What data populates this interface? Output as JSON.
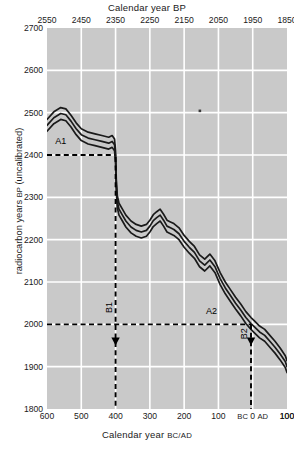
{
  "chart_data": {
    "type": "line",
    "title": "Calendar year BP",
    "xlabel": "Calendar year BC/AD",
    "ylabel": "radiocarbon years BP (uncalibrated)",
    "xlabel_top": "Calendar year BP",
    "ylim": [
      1800,
      2700
    ],
    "xlim_bcad": [
      600,
      -100
    ],
    "xlim_bp": [
      2550,
      1850
    ],
    "grid": true,
    "legend": "none",
    "y_ticks": [
      2700,
      2600,
      2500,
      2400,
      2300,
      2200,
      2100,
      2000,
      1900,
      1800
    ],
    "x_ticks_bcad": [
      "600",
      "500",
      "400",
      "300",
      "200",
      "100",
      "BC 0",
      "AD",
      "100"
    ],
    "x_ticks_top_bp": [
      "2550",
      "2450",
      "2350",
      "2250",
      "2150",
      "2050",
      "1950",
      "1850"
    ],
    "series": [
      {
        "name": "calibration curve (central)",
        "x_bcad": [
          600,
          580,
          560,
          545,
          530,
          515,
          500,
          480,
          460,
          440,
          420,
          410,
          403,
          400,
          398,
          395,
          390,
          380,
          370,
          355,
          340,
          325,
          310,
          300,
          290,
          280,
          270,
          260,
          250,
          240,
          230,
          215,
          200,
          185,
          170,
          155,
          140,
          125,
          110,
          95,
          80,
          65,
          50,
          35,
          20,
          5,
          -5,
          -20,
          -35,
          -50,
          -65,
          -80,
          -95,
          -100
        ],
        "y_bp": [
          2470,
          2488,
          2498,
          2495,
          2480,
          2462,
          2448,
          2440,
          2436,
          2432,
          2428,
          2432,
          2424,
          2395,
          2330,
          2290,
          2272,
          2258,
          2244,
          2230,
          2222,
          2218,
          2222,
          2232,
          2245,
          2252,
          2258,
          2246,
          2232,
          2228,
          2224,
          2214,
          2196,
          2182,
          2170,
          2150,
          2140,
          2152,
          2136,
          2108,
          2086,
          2068,
          2050,
          2034,
          2016,
          2002,
          1994,
          1982,
          1974,
          1960,
          1946,
          1930,
          1912,
          1900
        ]
      },
      {
        "name": "calibration curve (+1 sigma)",
        "offset_bp": 14
      },
      {
        "name": "calibration curve (-1 sigma)",
        "offset_bp": -14
      }
    ],
    "annotations": [
      {
        "id": "A1",
        "label": "A1",
        "type": "horizontal-dashed-line",
        "y_bp": 2400,
        "x_from_bcad": 600,
        "x_to_bcad": 403,
        "label_x_bcad": 560,
        "label_y_bp": 2425
      },
      {
        "id": "A2",
        "label": "A2",
        "type": "horizontal-dashed-line",
        "y_bp": 2000,
        "x_from_bcad": 600,
        "x_to_bcad": 5,
        "label_x_bcad": 120,
        "label_y_bp": 2025
      },
      {
        "id": "B1",
        "label": "B1",
        "type": "vertical-dashed-line-with-arrow",
        "x_bcad": 400,
        "y_from_bp": 2395,
        "y_to_bp": 1800,
        "arrow_y_bp": 1955,
        "label_y_bp": 2040
      },
      {
        "id": "B2",
        "label": "B2",
        "type": "vertical-dashed-line-with-arrow",
        "x_bcad": 5,
        "y_from_bp": 2000,
        "y_to_bp": 1800,
        "arrow_y_bp": 1955,
        "label_y_bp": 1978
      }
    ],
    "colors": {
      "plot_background": "#c9c9c9",
      "gridline": "#ffffff",
      "curve": "#1a1a1a",
      "annotation": "#000000",
      "page_background": "#ffffff"
    }
  }
}
